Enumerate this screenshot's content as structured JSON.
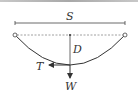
{
  "diagram": {
    "labels": {
      "span": "S",
      "sag": "D",
      "tension": "T",
      "weight": "W"
    },
    "colors": {
      "line": "#333333",
      "dashed": "#888888",
      "topbar": "#b0b0b0"
    }
  }
}
